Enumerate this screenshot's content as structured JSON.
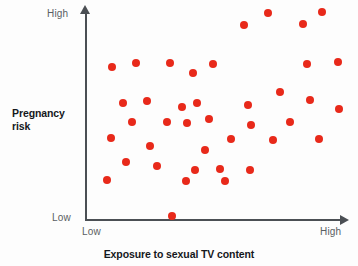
{
  "chart_data": {
    "type": "scatter",
    "title": "",
    "xlabel": "Exposure to sexual TV content",
    "ylabel": "Pregnancy risk",
    "x_tick_labels": [
      "Low",
      "High"
    ],
    "y_tick_labels": [
      "Low",
      "High"
    ],
    "xlim": [
      0,
      100
    ],
    "ylim": [
      0,
      100
    ],
    "grid": false,
    "legend": false,
    "point_color": "#e8291a",
    "axis_color": "#4b4f54",
    "background_color": "#fdfdfd",
    "n_points": 40,
    "points": [
      {
        "x": 10.5,
        "y": 72.9
      },
      {
        "x": 19.5,
        "y": 74.8
      },
      {
        "x": 32.4,
        "y": 74.8
      },
      {
        "x": 41.4,
        "y": 70.0
      },
      {
        "x": 49.0,
        "y": 74.3
      },
      {
        "x": 60.9,
        "y": 92.9
      },
      {
        "x": 70.1,
        "y": 98.6
      },
      {
        "x": 83.5,
        "y": 93.3
      },
      {
        "x": 90.7,
        "y": 99.0
      },
      {
        "x": 85.1,
        "y": 74.3
      },
      {
        "x": 96.9,
        "y": 75.2
      },
      {
        "x": 14.6,
        "y": 55.7
      },
      {
        "x": 23.8,
        "y": 56.7
      },
      {
        "x": 37.2,
        "y": 53.8
      },
      {
        "x": 42.9,
        "y": 55.7
      },
      {
        "x": 47.5,
        "y": 48.1
      },
      {
        "x": 62.5,
        "y": 54.8
      },
      {
        "x": 74.7,
        "y": 61.0
      },
      {
        "x": 86.2,
        "y": 57.1
      },
      {
        "x": 97.3,
        "y": 52.9
      },
      {
        "x": 9.9,
        "y": 39.0
      },
      {
        "x": 17.9,
        "y": 46.7
      },
      {
        "x": 31.4,
        "y": 46.7
      },
      {
        "x": 39.1,
        "y": 46.2
      },
      {
        "x": 55.9,
        "y": 38.6
      },
      {
        "x": 63.6,
        "y": 45.2
      },
      {
        "x": 78.5,
        "y": 46.7
      },
      {
        "x": 89.7,
        "y": 38.6
      },
      {
        "x": 24.9,
        "y": 35.2
      },
      {
        "x": 46.0,
        "y": 33.3
      },
      {
        "x": 72.0,
        "y": 38.1
      },
      {
        "x": 15.7,
        "y": 27.6
      },
      {
        "x": 27.6,
        "y": 25.7
      },
      {
        "x": 51.7,
        "y": 24.3
      },
      {
        "x": 8.4,
        "y": 19.0
      },
      {
        "x": 38.7,
        "y": 18.6
      },
      {
        "x": 53.6,
        "y": 18.6
      },
      {
        "x": 42.1,
        "y": 23.8
      },
      {
        "x": 63.2,
        "y": 23.8
      },
      {
        "x": 33.3,
        "y": 1.9
      }
    ]
  },
  "axes": {
    "y_title": "Pregnancy risk",
    "x_title": "Exposure to sexual TV content",
    "y_high_label": "High",
    "y_low_label": "Low",
    "x_low_label": "Low",
    "x_high_label": "High"
  }
}
